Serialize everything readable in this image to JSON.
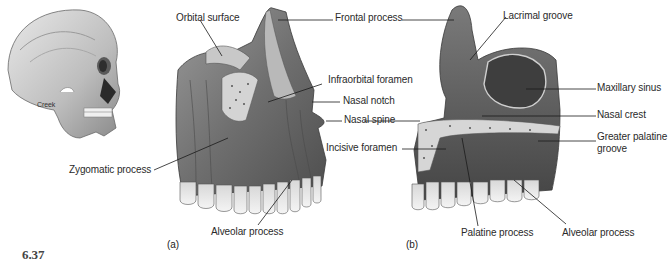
{
  "figure": {
    "number": "6.37",
    "credit": "Creek",
    "panels": [
      {
        "id": "a",
        "label": "(a)"
      },
      {
        "id": "b",
        "label": "(b)"
      }
    ]
  },
  "labels": {
    "a": {
      "orbital_surface": "Orbital surface",
      "frontal_process": "Frontal process",
      "infraorbital_foramen": "Infraorbital foramen",
      "nasal_notch": "Nasal notch",
      "nasal_spine": "Nasal spine",
      "zygomatic_process": "Zygomatic process",
      "alveolar_process": "Alveolar process"
    },
    "b": {
      "lacrimal_groove": "Lacrimal groove",
      "maxillary_sinus": "Maxillary sinus",
      "nasal_crest": "Nasal crest",
      "greater_palatine_groove": "Greater palatine groove",
      "incisive_foramen": "Incisive foramen",
      "palatine_process": "Palatine process",
      "alveolar_process": "Alveolar process"
    }
  },
  "colors": {
    "bone_dark": "#5e5e5e",
    "bone_mid": "#8d8d8d",
    "bone_light": "#cfcfcf",
    "tooth": "#e6e6e6",
    "leader": "#1a1a1a"
  }
}
